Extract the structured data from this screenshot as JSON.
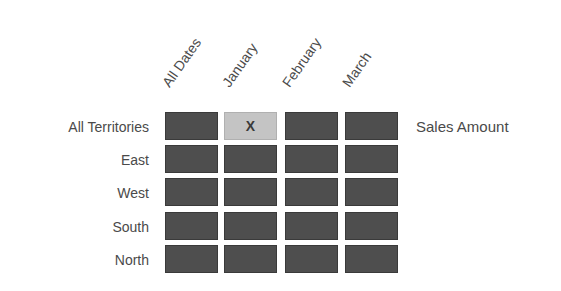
{
  "columns": [
    "All Dates",
    "January",
    "February",
    "March"
  ],
  "rows": [
    "All Territories",
    "East",
    "West",
    "South",
    "North"
  ],
  "measure_label": "Sales Amount",
  "selected_cell": {
    "row": 0,
    "col": 1,
    "mark": "X"
  },
  "colors": {
    "cell": "#4e4e4e",
    "selected_cell": "#c4c4c4",
    "text": "#4a4a4a"
  }
}
